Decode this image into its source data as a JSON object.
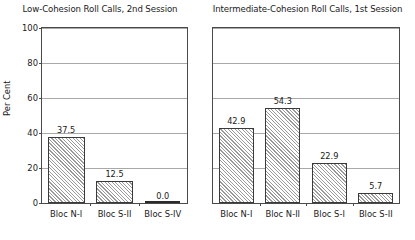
{
  "chart_data": [
    {
      "type": "bar",
      "panel": "left",
      "title": "Low-Cohesion Roll Calls, 2nd Session",
      "categories": [
        "Bloc N-I",
        "Bloc S-II",
        "Bloc S-IV"
      ],
      "values": [
        37.5,
        12.5,
        0.0
      ],
      "value_labels": [
        "37.5",
        "12.5",
        "0.0"
      ],
      "xlabel": "",
      "ylabel": "Per Cent",
      "ylim": [
        0,
        100
      ],
      "yticks": [
        0,
        20,
        40,
        60,
        80,
        100
      ],
      "ytick_labels": [
        "0",
        "20",
        "40",
        "60",
        "80",
        "100"
      ],
      "grid": true,
      "legend": "none",
      "show_yaxis": true
    },
    {
      "type": "bar",
      "panel": "right",
      "title": "Intermediate-Cohesion Roll Calls, 1st Session",
      "categories": [
        "Bloc N-I",
        "Bloc N-II",
        "Bloc S-I",
        "Bloc S-II"
      ],
      "values": [
        42.9,
        54.3,
        22.9,
        5.7
      ],
      "value_labels": [
        "42.9",
        "54.3",
        "22.9",
        "5.7"
      ],
      "xlabel": "",
      "ylabel": "",
      "ylim": [
        0,
        100
      ],
      "yticks": [
        0,
        20,
        40,
        60,
        80,
        100
      ],
      "ytick_labels": [
        "0",
        "20",
        "40",
        "60",
        "80",
        "100"
      ],
      "grid": true,
      "legend": "none",
      "show_yaxis": false
    }
  ],
  "style": {
    "frame_color": "#4a4a4a",
    "grid_color": "#a8a8a8",
    "bar_edge_color": "#3a3a3a",
    "bar_hatch_color": "#9a9a9a",
    "background": "#ffffff",
    "text_color": "#1a1a1a"
  }
}
